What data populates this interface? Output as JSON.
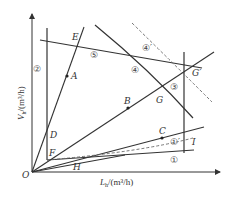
{
  "diagram": {
    "type": "operating-range diagram (gas-liquid flow loads)",
    "axes": {
      "x_label": "L_h/(m³/h)",
      "x_label_main": "L",
      "x_label_sub": "h",
      "x_label_unit": "/(m³/h)",
      "y_label": "V_h/(m³/h)",
      "y_label_main": "V",
      "y_label_sub": "h",
      "y_label_unit": "/(m³/h)",
      "origin": "O"
    },
    "points": {
      "O": "O",
      "A": "A",
      "B": "B",
      "C": "C",
      "D": "D",
      "E": "E",
      "F": "F",
      "G": "G",
      "G_prime": "G′",
      "H": "H",
      "I": "I"
    },
    "curves": {
      "c1": "①",
      "c1_prime": "①′",
      "c2": "②",
      "c3": "③",
      "c4": "④",
      "c4_prime": "④′",
      "c5": "⑤"
    },
    "colors": {
      "line": "#333333",
      "dashed": "#666666",
      "background": "#ffffff"
    }
  }
}
